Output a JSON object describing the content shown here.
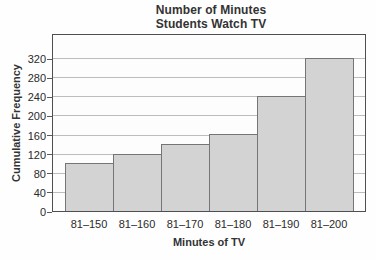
{
  "chart_data": {
    "type": "bar",
    "title_line1": "Number of Minutes",
    "title_line2": "Students Watch TV",
    "xlabel": "Minutes of TV",
    "ylabel": "Cumulative Frequency",
    "categories": [
      "81–150",
      "81–160",
      "81–170",
      "81–180",
      "81–190",
      "81–200"
    ],
    "values": [
      100,
      120,
      140,
      160,
      240,
      320
    ],
    "yticks": [
      0,
      40,
      80,
      120,
      160,
      200,
      240,
      280,
      320
    ],
    "ylim": [
      0,
      372
    ],
    "grid": "horizontal",
    "legend": "none",
    "colors": {
      "bar_fill": "#d3d3d3",
      "bar_border": "#757575",
      "gridline": "#bcbcbc",
      "plot_border": "#4f4f4f",
      "text": "#333333",
      "background": "#fefefe"
    }
  }
}
